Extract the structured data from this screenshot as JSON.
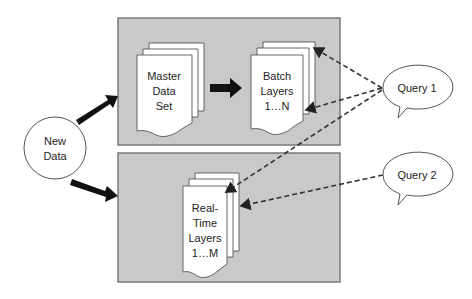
{
  "diagram": {
    "new_data": {
      "lines": [
        "New",
        "Data"
      ]
    },
    "batch_panel": {
      "master": {
        "lines": [
          "Master",
          "Data",
          "Set"
        ]
      },
      "batch": {
        "lines": [
          "Batch",
          "Layers",
          "1…N"
        ]
      }
    },
    "realtime_panel": {
      "realtime": {
        "lines": [
          "Real-",
          "Time",
          "Layers",
          "1…M"
        ]
      }
    },
    "queries": [
      {
        "label": "Query 1"
      },
      {
        "label": "Query 2"
      }
    ],
    "colors": {
      "panel": "#c9c9c9",
      "panel_border": "#7a7a7a",
      "arrow": "#111111",
      "dash": "#333333"
    }
  }
}
